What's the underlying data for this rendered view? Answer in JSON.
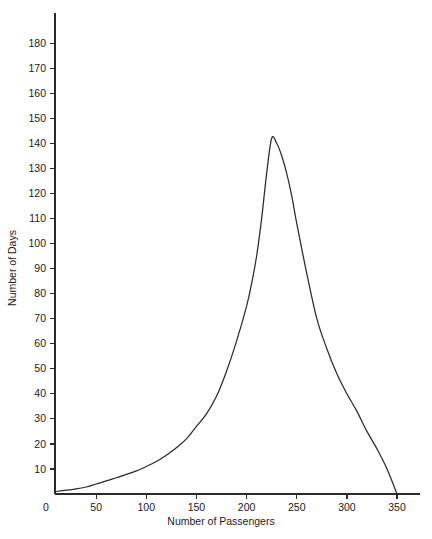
{
  "chart_data": {
    "type": "line",
    "title": "",
    "subtitle": "",
    "xlabel": "Number of Passengers",
    "ylabel": "Number of Days",
    "xlim": [
      0,
      375
    ],
    "ylim": [
      0,
      188
    ],
    "grid": false,
    "legend": null,
    "legend_position": "none",
    "annotations": [],
    "xticks": [
      0,
      50,
      100,
      150,
      200,
      250,
      300,
      350
    ],
    "xtick_labels": [
      "0",
      "50",
      "100",
      "150",
      "200",
      "250",
      "300",
      "350"
    ],
    "yticks": [
      10,
      20,
      30,
      40,
      50,
      60,
      70,
      80,
      90,
      100,
      110,
      120,
      130,
      140,
      150,
      160,
      170,
      180
    ],
    "ytick_labels": [
      "10",
      "20",
      "30",
      "40",
      "50",
      "60",
      "70",
      "80",
      "90",
      "100",
      "110",
      "120",
      "130",
      "140",
      "150",
      "160",
      "170",
      "180"
    ],
    "series": [
      {
        "name": "Number of Days",
        "color": "#2b2b2b",
        "x": [
          10,
          20,
          30,
          40,
          50,
          60,
          70,
          80,
          90,
          100,
          110,
          120,
          130,
          140,
          150,
          160,
          170,
          180,
          190,
          200,
          205,
          210,
          215,
          220,
          225,
          230,
          235,
          240,
          245,
          250,
          260,
          270,
          280,
          290,
          300,
          310,
          320,
          330,
          340,
          350
        ],
        "y": [
          1,
          1.5,
          2,
          2.8,
          4,
          5.2,
          6.5,
          7.8,
          9.2,
          11,
          13,
          15.5,
          18.5,
          22,
          27,
          32,
          39,
          49,
          61,
          75,
          84,
          95,
          110,
          128,
          142,
          140,
          135,
          128,
          119,
          108,
          88,
          70,
          58,
          48,
          40,
          33,
          25,
          18,
          10,
          0
        ]
      }
    ]
  },
  "axes": {
    "y_axis_label": "Number of Days",
    "x_axis_label": "Number of Passengers"
  }
}
